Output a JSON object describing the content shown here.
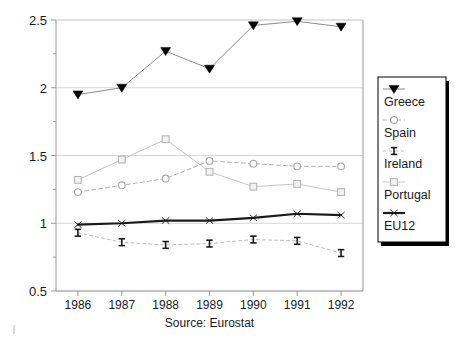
{
  "chart_data": {
    "type": "line",
    "title": "",
    "subtitle": "",
    "xlabel": "Source: Eurostat",
    "ylabel": "",
    "categories": [
      "1986",
      "1987",
      "1988",
      "1989",
      "1990",
      "1991",
      "1992"
    ],
    "x": [
      1986,
      1987,
      1988,
      1989,
      1990,
      1991,
      1992
    ],
    "xlim": [
      1985.5,
      1992.5
    ],
    "ylim": [
      0.5,
      2.5
    ],
    "yticks": [
      0.5,
      1,
      1.5,
      2,
      2.5
    ],
    "ytick_labels": [
      "0.5",
      "1",
      "1.5",
      "2",
      "2.5"
    ],
    "y_minor_ticks": [
      0.75,
      1.25,
      1.75,
      2.25
    ],
    "grid": "horizontal",
    "legend_position": "right",
    "series": [
      {
        "name": "Greece",
        "marker": "triangle-down-filled",
        "color": "#8c8c8c",
        "marker_color": "#000000",
        "line_width": 1,
        "values": [
          1.95,
          2.0,
          2.27,
          2.14,
          2.46,
          2.49,
          2.45
        ]
      },
      {
        "name": "Spain",
        "marker": "circle-open",
        "color": "#b0b0b0",
        "marker_color": "#a8a8a8",
        "line_width": 1,
        "dash": "4 3",
        "values": [
          1.23,
          1.28,
          1.33,
          1.46,
          1.44,
          1.42,
          1.42
        ]
      },
      {
        "name": "Ireland",
        "marker": "ibar",
        "color": "#bdbdbd",
        "marker_color": "#1a1a1a",
        "line_width": 1,
        "dash": "3 3",
        "values": [
          0.93,
          0.86,
          0.84,
          0.85,
          0.88,
          0.87,
          0.78
        ]
      },
      {
        "name": "Portugal",
        "marker": "square-open",
        "color": "#c4c4c4",
        "marker_color": "#b5b5b5",
        "line_width": 1,
        "values": [
          1.32,
          1.47,
          1.62,
          1.38,
          1.27,
          1.29,
          1.23
        ]
      },
      {
        "name": "EU12",
        "marker": "x-thin",
        "color": "#1a1a1a",
        "marker_color": "#1a1a1a",
        "line_width": 2.2,
        "values": [
          0.99,
          1.0,
          1.02,
          1.02,
          1.04,
          1.07,
          1.06
        ]
      }
    ],
    "legend_entries": [
      "Greece",
      "Spain",
      "Ireland",
      "Portugal",
      "EU12"
    ],
    "axis_color": "#9a9a9a",
    "grid_color": "#d6d6d6",
    "background": "#ffffff"
  }
}
